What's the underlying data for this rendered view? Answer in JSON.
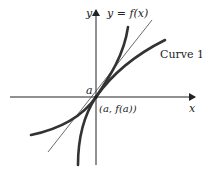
{
  "figure": {
    "axes": {
      "x_label": "x",
      "y_label": "y"
    },
    "labels": {
      "function": "y = f(x)",
      "curve1": "Curve 1",
      "point_a": "a",
      "point": "(a, f(a))"
    },
    "colors": {
      "curve": "#333333",
      "tangent": "#444444",
      "axis": "#222222"
    }
  }
}
